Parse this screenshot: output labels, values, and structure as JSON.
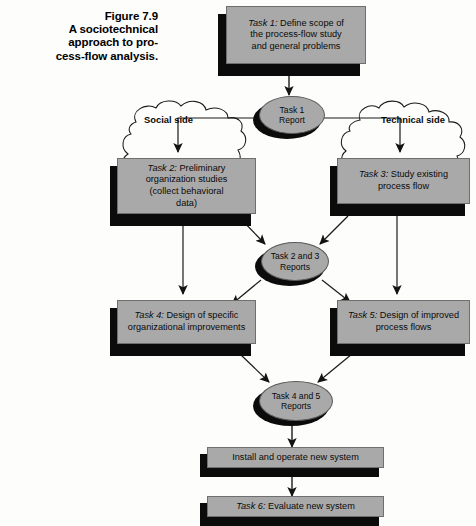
{
  "figure": {
    "caption_lines": [
      "Figure 7.9",
      "A sociotechnical",
      "approach to pro-",
      "cess-flow analysis."
    ],
    "caption_full": "Figure 7.9 A sociotechnical approach to process-flow analysis."
  },
  "colors": {
    "box_fill": "#a9a9a9",
    "box_shadow": "#0b0b0b",
    "box_stroke": "#6f6f6f",
    "background": "#fdfdfb",
    "line": "#1a1a1a",
    "text": "#0a0a0a"
  },
  "clouds": [
    {
      "id": "social",
      "label": "Social side"
    },
    {
      "id": "technical",
      "label": "Technical side"
    }
  ],
  "tasks": [
    {
      "id": "task1",
      "tag": "Task 1:",
      "text": "  Define scope of\nthe process-flow study\nand general problems",
      "full": "Task 1: Define scope of the process-flow study and general problems"
    },
    {
      "id": "task2",
      "tag": "Task 2:",
      "text": "  Preliminary\norganization studies\n(collect behavioral\ndata)",
      "full": "Task 2: Preliminary organization studies (collect behavioral data)"
    },
    {
      "id": "task3",
      "tag": "Task 3:",
      "text": "  Study existing\nprocess flow",
      "full": "Task 3: Study existing process flow"
    },
    {
      "id": "task4",
      "tag": "Task 4:",
      "text": "  Design of specific\norganizational improvements",
      "full": "Task 4: Design of specific organizational improvements"
    },
    {
      "id": "task5",
      "tag": "Task 5:",
      "text": "  Design of improved\nprocess flows",
      "full": "Task 5: Design of improved process flows"
    },
    {
      "id": "install",
      "tag": "",
      "text": "Install and operate new system",
      "full": "Install and operate new system"
    },
    {
      "id": "task6",
      "tag": "Task 6:",
      "text": "  Evaluate new system",
      "full": "Task 6: Evaluate new system"
    }
  ],
  "reports": [
    {
      "id": "report1",
      "label": "Task 1\nReport",
      "full": "Task 1 Report"
    },
    {
      "id": "report23",
      "label": "Task 2 and 3\nReports",
      "full": "Task 2 and 3 Reports"
    },
    {
      "id": "report45",
      "label": "Task 4 and 5\nReports",
      "full": "Task 4 and 5 Reports"
    }
  ]
}
